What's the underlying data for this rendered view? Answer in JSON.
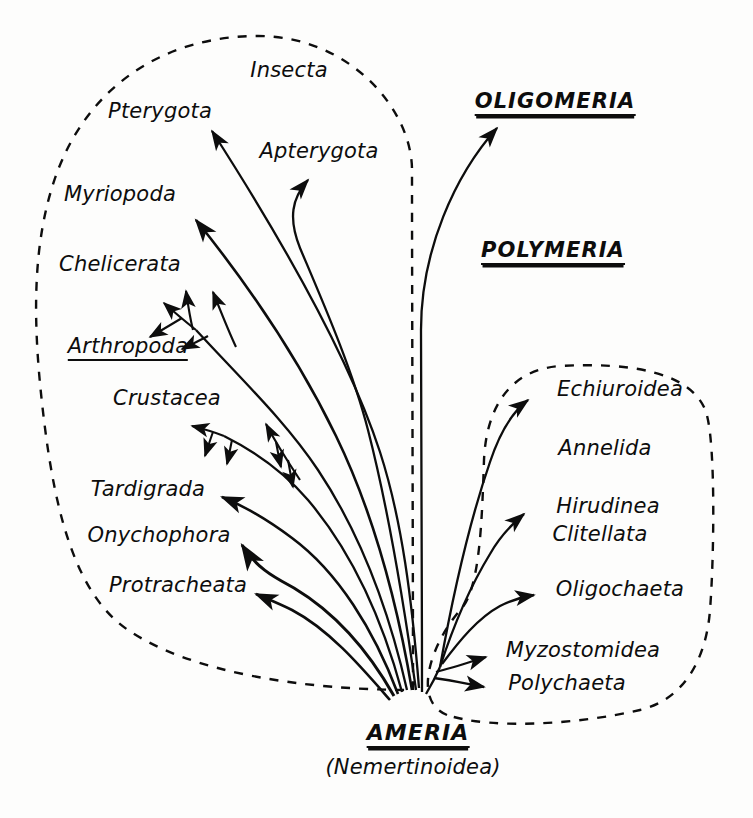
{
  "figure": {
    "type": "phylogenetic-tree",
    "background_color": "#fdfdfc",
    "ink_color": "#0d0d0d",
    "root": {
      "name": "AMERIA",
      "subtitle": "(Nemertinoidea)",
      "underline": "double"
    },
    "grades": [
      {
        "name": "OLIGOMERIA",
        "underline": "double",
        "x": 555,
        "y": 104
      },
      {
        "name": "POLYMERIA",
        "underline": "double",
        "x": 553,
        "y": 253
      }
    ],
    "clade_boxes": [
      {
        "name": "Arthropoda group",
        "style": "dashed"
      },
      {
        "name": "Annelida group",
        "style": "dashed"
      }
    ],
    "labels": [
      {
        "text": "Insecta",
        "x": 289,
        "y": 72,
        "anchor": "center",
        "underline": "none"
      },
      {
        "text": "Pterygota",
        "x": 160,
        "y": 113,
        "anchor": "center",
        "underline": "none"
      },
      {
        "text": "Apterygota",
        "x": 319,
        "y": 153,
        "anchor": "center",
        "underline": "none"
      },
      {
        "text": "Myriopoda",
        "x": 120,
        "y": 196,
        "anchor": "center",
        "underline": "none"
      },
      {
        "text": "Chelicerata",
        "x": 120,
        "y": 266,
        "anchor": "center",
        "underline": "none"
      },
      {
        "text": "Arthropoda",
        "x": 128,
        "y": 348,
        "anchor": "center",
        "underline": "single"
      },
      {
        "text": "Crustacea",
        "x": 167,
        "y": 400,
        "anchor": "center",
        "underline": "none"
      },
      {
        "text": "Tardigrada",
        "x": 148,
        "y": 491,
        "anchor": "center",
        "underline": "none"
      },
      {
        "text": "Onychophora",
        "x": 159,
        "y": 537,
        "anchor": "center",
        "underline": "none"
      },
      {
        "text": "Protracheata",
        "x": 178,
        "y": 587,
        "anchor": "center",
        "underline": "none"
      },
      {
        "text": "Echiuroidea",
        "x": 620,
        "y": 391,
        "anchor": "center",
        "underline": "none"
      },
      {
        "text": "Annelida",
        "x": 605,
        "y": 450,
        "anchor": "center",
        "underline": "none"
      },
      {
        "text": "Hirudinea",
        "x": 608,
        "y": 508,
        "anchor": "center",
        "underline": "none"
      },
      {
        "text": "Clitellata",
        "x": 600,
        "y": 536,
        "anchor": "center",
        "underline": "none"
      },
      {
        "text": "Oligochaeta",
        "x": 620,
        "y": 591,
        "anchor": "center",
        "underline": "none"
      },
      {
        "text": "Myzostomidea",
        "x": 583,
        "y": 652,
        "anchor": "center",
        "underline": "none"
      },
      {
        "text": "Polychaeta",
        "x": 567,
        "y": 685,
        "anchor": "center",
        "underline": "none"
      }
    ],
    "branch_count_from_root": 11,
    "sub_branch_groups": [
      {
        "parent": "Chelicerata",
        "arrow_count": 5
      },
      {
        "parent": "Crustacea",
        "arrow_count": 4
      }
    ]
  }
}
